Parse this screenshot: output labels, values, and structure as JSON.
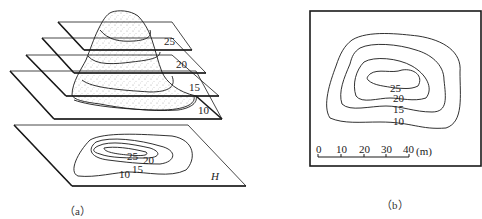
{
  "figure_a": {
    "caption": "（a）",
    "planes": [
      {
        "elevation": "25"
      },
      {
        "elevation": "20"
      },
      {
        "elevation": "15"
      },
      {
        "elevation": "10"
      }
    ],
    "projection_plane_label": "H",
    "projection_contour_labels": [
      "25",
      "20",
      "15",
      "10"
    ]
  },
  "figure_b": {
    "caption": "（b）",
    "contour_labels": [
      "25",
      "20",
      "15",
      "10"
    ],
    "scale_bar": {
      "ticks": [
        "0",
        "10",
        "20",
        "30",
        "40"
      ],
      "unit": "(m)"
    }
  },
  "colors": {
    "line": "#1a1a1a",
    "background": "#ffffff",
    "stipple": "#9a9a9a"
  }
}
